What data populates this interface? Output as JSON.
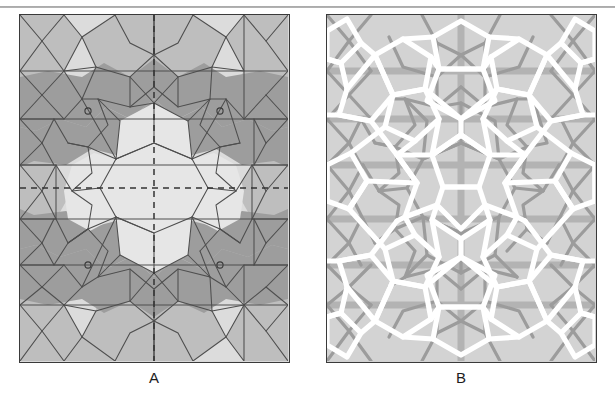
{
  "figure": {
    "top_rule": "horizontal-rule",
    "panels": [
      {
        "id": "A",
        "label": "A",
        "description": "Girih tile patch with shaded polygon tiles, tile outlines and dashed mirror axes",
        "background_color": "#d9d9d9",
        "tile_fill_light": "#dedede",
        "tile_fill_medium": "#bcbcbc",
        "tile_fill_dark": "#9b9b9b",
        "outline_color": "#4a4a4a",
        "dashed_axis_color": "#3c3c3c",
        "marker": "small-circle",
        "marker_count": 4
      },
      {
        "id": "B",
        "label": "B",
        "description": "Same patch rendered as white interlaced strapwork over grey girih line network",
        "background_color": "#d2d2d2",
        "strap_color": "#ffffff",
        "underlay_line_color": "#a6a6a6",
        "underlay_shadow_color": "#8f8f8f",
        "border_color": "#3a3a3a"
      }
    ],
    "colors": {
      "border": "#3a3a3a",
      "rule": "#8e8e8e",
      "label_text": "#1d1d1d",
      "page_background": "#ffffff"
    }
  }
}
